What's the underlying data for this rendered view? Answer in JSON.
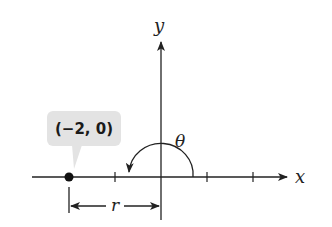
{
  "diagram": {
    "axes": {
      "x_label": "x",
      "y_label": "y"
    },
    "point": {
      "label": "(−2, 0)",
      "x": -2,
      "y": 0
    },
    "angle": {
      "label": "θ"
    },
    "distance": {
      "label": "r"
    },
    "colors": {
      "line": "#222222",
      "callout_fill": "#e3e3e3",
      "point": "#111111"
    }
  }
}
